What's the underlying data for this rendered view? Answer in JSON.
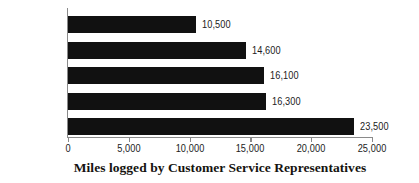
{
  "chart_data": {
    "type": "bar",
    "orientation": "horizontal",
    "title": "Miles logged by Customer Service Representatives",
    "title_position": "bottom",
    "xlabel": "Miles logged by Customer Service Representatives",
    "ylabel": "",
    "categories": [
      "December",
      "November",
      "October",
      "September",
      "August"
    ],
    "values": [
      10500,
      14600,
      16100,
      16300,
      23500
    ],
    "value_labels": [
      "10,500",
      "14,600",
      "16,100",
      "16,300",
      "23,500"
    ],
    "xlim": [
      0,
      25000
    ],
    "xticks": [
      0,
      5000,
      10000,
      15000,
      20000,
      25000
    ],
    "xtick_labels": [
      "0",
      "5,000",
      "10,000",
      "15,000",
      "20,000",
      "25,000"
    ],
    "grid": false,
    "legend": false,
    "bar_color": "#111111",
    "axis_color": "#8a8a8a",
    "text_color": "#1b1b1b",
    "background": "#ffffff"
  }
}
